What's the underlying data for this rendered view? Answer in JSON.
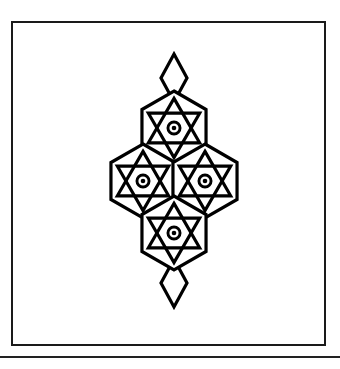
{
  "page": {
    "background_color": "#ffffff",
    "width": 340,
    "height": 369
  },
  "frame": {
    "name": "plate-border",
    "stroke_color": "#1a1a1a",
    "stroke_width": 2,
    "x": 11,
    "y": 21,
    "width": 315,
    "height": 325,
    "fill": "#ffffff"
  },
  "bottom_rule": {
    "name": "horizontal-divider-rule",
    "color": "#222222",
    "y": 356,
    "thickness": 2
  },
  "caption": {
    "text": ""
  },
  "artwork": {
    "name": "interlaced-hexagram-rosette",
    "description": "Four interlaced hexagram rosettes arranged in a rhombus, with diamond finials above and below",
    "stroke_color": "#000000",
    "stroke_width": 3.2,
    "fill": "#ffffff",
    "motif_radius": 37,
    "motifs": [
      {
        "id": "motif-top",
        "cx": 174,
        "cy": 128,
        "label": "top-rosette"
      },
      {
        "id": "motif-left",
        "cx": 143,
        "cy": 181,
        "label": "left-rosette"
      },
      {
        "id": "motif-right",
        "cx": 205,
        "cy": 181,
        "label": "right-rosette"
      },
      {
        "id": "motif-bottom",
        "cx": 174,
        "cy": 233,
        "label": "bottom-rosette"
      }
    ],
    "finials": [
      {
        "id": "finial-top",
        "cx": 174,
        "cy": 78,
        "label": "top-diamond-finial",
        "half_width": 13,
        "half_height": 24
      },
      {
        "id": "finial-bottom",
        "cx": 174,
        "cy": 283,
        "label": "bottom-diamond-finial",
        "half_width": 13,
        "half_height": 24
      }
    ],
    "center_dots": [
      {
        "id": "dot-top",
        "cx": 174,
        "cy": 128,
        "ring_outer": 7.5,
        "ring_inner": 4.6,
        "dot_radius": 2.3
      },
      {
        "id": "dot-left",
        "cx": 143,
        "cy": 181,
        "ring_outer": 7.5,
        "ring_inner": 4.6,
        "dot_radius": 2.3
      },
      {
        "id": "dot-right",
        "cx": 205,
        "cy": 181,
        "ring_outer": 7.5,
        "ring_inner": 4.6,
        "dot_radius": 2.3
      },
      {
        "id": "dot-bottom",
        "cx": 174,
        "cy": 233,
        "ring_outer": 7.5,
        "ring_inner": 4.6,
        "dot_radius": 2.3
      }
    ],
    "extent": {
      "left": 106,
      "right": 243,
      "top": 62,
      "bottom": 301
    }
  }
}
